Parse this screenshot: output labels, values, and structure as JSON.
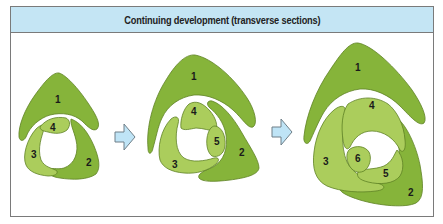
{
  "header": {
    "title": "Continuing development (transverse sections)"
  },
  "colors": {
    "header_bg": "#c4e5f4",
    "border": "#7a7a7a",
    "dark_green": "#86b43a",
    "light_green": "#abcd5c",
    "outline_green": "#5e8124",
    "arrow_fill": "#bfe4f6",
    "arrow_stroke": "#6f7f88"
  },
  "stages": [
    {
      "name": "stage-1",
      "segments": [
        {
          "label": "1",
          "tone": "dark"
        },
        {
          "label": "2",
          "tone": "dark"
        },
        {
          "label": "3",
          "tone": "light"
        },
        {
          "label": "4",
          "tone": "light"
        }
      ]
    },
    {
      "name": "stage-2",
      "segments": [
        {
          "label": "1",
          "tone": "dark"
        },
        {
          "label": "2",
          "tone": "dark"
        },
        {
          "label": "3",
          "tone": "light"
        },
        {
          "label": "4",
          "tone": "light"
        },
        {
          "label": "5",
          "tone": "light"
        }
      ]
    },
    {
      "name": "stage-3",
      "segments": [
        {
          "label": "1",
          "tone": "dark"
        },
        {
          "label": "2",
          "tone": "dark"
        },
        {
          "label": "3",
          "tone": "light"
        },
        {
          "label": "4",
          "tone": "light"
        },
        {
          "label": "5",
          "tone": "light"
        },
        {
          "label": "6",
          "tone": "light"
        }
      ]
    }
  ],
  "arrows": [
    {
      "direction": "right",
      "from": "stage-1",
      "to": "stage-2"
    },
    {
      "direction": "right",
      "from": "stage-2",
      "to": "stage-3"
    }
  ]
}
